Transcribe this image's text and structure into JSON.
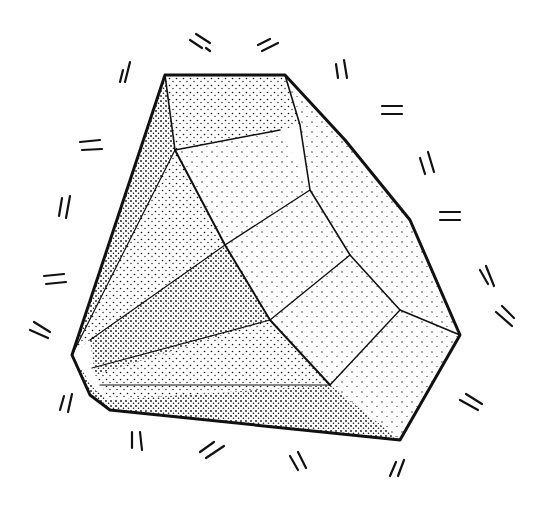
{
  "illustration": {
    "subject": "stippled faceted crystal",
    "colors": {
      "ink": "#111111",
      "paper": "#ffffff"
    }
  }
}
